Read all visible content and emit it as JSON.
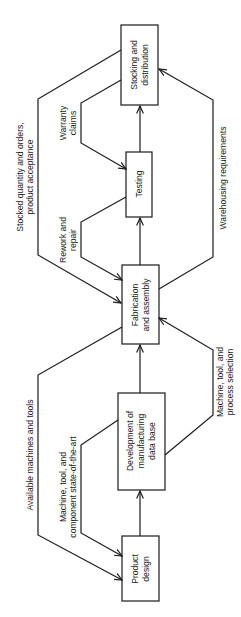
{
  "diagram": {
    "title": "",
    "orientation": "rotated-90-ccw",
    "colors": {
      "stroke": "#1a1a1a",
      "background": "#ffffff"
    },
    "nodes": [
      {
        "id": "product_design",
        "lines": [
          "Product",
          "design"
        ]
      },
      {
        "id": "development",
        "lines": [
          "Development of",
          "manufacturing",
          "data base"
        ]
      },
      {
        "id": "fabrication",
        "lines": [
          "Fabrication",
          "and assembly"
        ]
      },
      {
        "id": "testing",
        "lines": [
          "Testing"
        ]
      },
      {
        "id": "stocking",
        "lines": [
          "Stocking and",
          "distribution"
        ]
      }
    ],
    "edges": [
      {
        "from": "product_design",
        "to": "development",
        "label": ""
      },
      {
        "from": "development",
        "to": "fabrication",
        "label": ""
      },
      {
        "from": "fabrication",
        "to": "testing",
        "label": ""
      },
      {
        "from": "testing",
        "to": "stocking",
        "label": ""
      },
      {
        "from": "stocking",
        "to": "fabrication",
        "label_lines": [
          "Stocked quantity and orders,",
          "product acceptance"
        ]
      },
      {
        "from": "stocking",
        "to": "testing",
        "label_lines": [
          "Warranty",
          "claims"
        ]
      },
      {
        "from": "testing",
        "to": "fabrication",
        "label_lines": [
          "Rework and",
          "repair"
        ]
      },
      {
        "from": "fabrication",
        "to": "stocking",
        "label_lines": [
          "Warehousing requirements"
        ]
      },
      {
        "from": "fabrication",
        "to": "product_design",
        "label_lines": [
          "Available machines and tools"
        ]
      },
      {
        "from": "development",
        "to": "product_design",
        "label_lines": [
          "Machine, tool, and",
          "component state-of-the-art"
        ]
      },
      {
        "from": "development",
        "to": "fabrication",
        "label_lines": [
          "Machine, tool, and",
          "process selection"
        ]
      }
    ]
  }
}
